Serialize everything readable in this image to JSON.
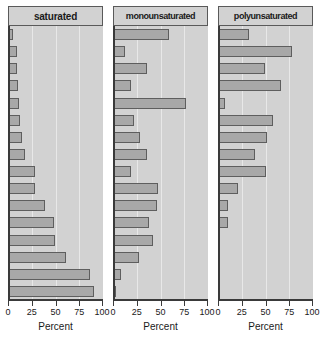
{
  "chart_data": {
    "type": "bar",
    "orientation": "horizontal",
    "title": "",
    "xlabel": "Percent",
    "ylabel": "",
    "xlim": [
      0,
      100
    ],
    "xticks": [
      0,
      25,
      50,
      75,
      100
    ],
    "xticklabels": [
      "0",
      "25",
      "50",
      "75",
      "100"
    ],
    "grid": true,
    "gridlines_at": [
      25,
      50,
      75
    ],
    "legend": "none",
    "panel_layout": "1 row x 3 columns, shared y ordering",
    "n_rows": 16,
    "categories": [
      "row-1",
      "row-2",
      "row-3",
      "row-4",
      "row-5",
      "row-6",
      "row-7",
      "row-8",
      "row-9",
      "row-10",
      "row-11",
      "row-12",
      "row-13",
      "row-14",
      "row-15",
      "row-16"
    ],
    "panels": [
      {
        "name": "saturated",
        "title": "saturated",
        "values": [
          5,
          9,
          9,
          10,
          12,
          13,
          15,
          18,
          28,
          28,
          39,
          48,
          49,
          61,
          86,
          90
        ]
      },
      {
        "name": "monounsaturated",
        "title": "monounsaturated",
        "values": [
          59,
          13,
          36,
          19,
          77,
          22,
          28,
          36,
          19,
          47,
          46,
          38,
          42,
          27,
          8,
          3
        ]
      },
      {
        "name": "polyunsaturated",
        "title": "polyunsaturated",
        "values": [
          33,
          78,
          49,
          66,
          7,
          58,
          52,
          39,
          50,
          21,
          11,
          10,
          2,
          1,
          1,
          1
        ]
      }
    ],
    "colors": {
      "bar_fill": "#a8a8a8",
      "bar_stroke": "#5e5e5e",
      "panel_background": "#d2d2d2",
      "strip_background": "#d2d2d2",
      "gridline": "#e8e8e8",
      "axis": "#3a3a3a",
      "text": "#1a1a1a",
      "page_background": "#ffffff"
    }
  }
}
